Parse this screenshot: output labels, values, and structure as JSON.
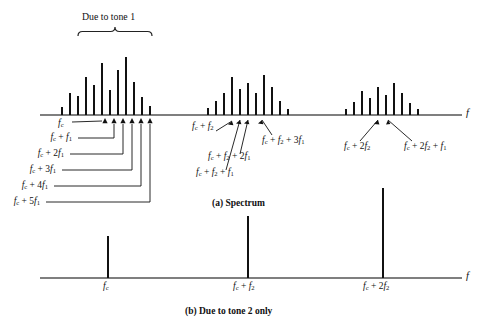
{
  "figure": {
    "bracket_label": "Due to tone 1",
    "axis_symbol": "f",
    "caption_a": "(a) Spectrum",
    "caption_b": "(b) Due to tone 2 only",
    "ink_color": "#111111",
    "axis_color": "#555555"
  },
  "panel_a": {
    "name": "Spectrum",
    "axis_label": "f",
    "cascade_labels": [
      {
        "id": "fc",
        "text": "fc",
        "html": "<i>f</i><sub>c</sub>"
      },
      {
        "id": "fc_f1",
        "text": "fc + f1",
        "html": "<i>f</i><sub>c</sub> + <i>f</i><sub>1</sub>"
      },
      {
        "id": "fc_2f1",
        "text": "fc + 2f1",
        "html": "<i>f</i><sub>c</sub> + 2<i>f</i><sub>1</sub>"
      },
      {
        "id": "fc_3f1",
        "text": "fc + 3f1",
        "html": "<i>f</i><sub>c</sub> + 3<i>f</i><sub>1</sub>"
      },
      {
        "id": "fc_4f1",
        "text": "fc + 4f1",
        "html": "<i>f</i><sub>c</sub> + 4<i>f</i><sub>1</sub>"
      },
      {
        "id": "fc_5f1",
        "text": "fc + 5f1",
        "html": "<i>f</i><sub>c</sub> + 5<i>f</i><sub>1</sub>"
      }
    ],
    "cluster2_labels": [
      {
        "id": "fc_f2",
        "text": "fc + f2",
        "html": "<i>f</i><sub>c</sub> + <i>f</i><sub>2</sub>"
      },
      {
        "id": "fc_f2_f1",
        "text": "fc + f2 + f1",
        "html": "<i>f</i><sub>c</sub> + <i>f</i><sub>2</sub> + <i>f</i><sub>1</sub>"
      },
      {
        "id": "fc_f2_2f1",
        "text": "fc + f2 + 2f1",
        "html": "<i>f</i><sub>c</sub> + <i>f</i><sub>2</sub> + 2<i>f</i><sub>1</sub>"
      },
      {
        "id": "fc_f2_3f1",
        "text": "fc + f2 + 3f1",
        "html": "<i>f</i><sub>c</sub> + <i>f</i><sub>2</sub> + 3<i>f</i><sub>1</sub>"
      }
    ],
    "cluster3_labels": [
      {
        "id": "fc_2f2",
        "text": "fc + 2f2",
        "html": "<i>f</i><sub>c</sub> + 2<i>f</i><sub>2</sub>"
      },
      {
        "id": "fc_2f2_f1",
        "text": "fc + 2f2 + f1",
        "html": "<i>f</i><sub>c</sub> + 2<i>f</i><sub>2</sub> + <i>f</i><sub>1</sub>"
      }
    ]
  },
  "panel_b": {
    "name": "Due to tone 2 only",
    "axis_label": "f",
    "tick_labels": [
      {
        "id": "fc",
        "text": "fc",
        "html": "<i>f</i><sub>c</sub>"
      },
      {
        "id": "fc_f2",
        "text": "fc + f2",
        "html": "<i>f</i><sub>c</sub> + <i>f</i><sub>2</sub>"
      },
      {
        "id": "fc_2f2",
        "text": "fc + 2f2",
        "html": "<i>f</i><sub>c</sub> + 2<i>f</i><sub>2</sub>"
      }
    ]
  },
  "chart_data": {
    "type": "bar",
    "xlabel": "f",
    "ylabel": "",
    "grid": false,
    "legend": null,
    "axis_baseline_a": 115,
    "axis_baseline_b": 278,
    "panels": [
      {
        "id": "a",
        "caption": "(a) Spectrum",
        "axis_label": "f",
        "axis_x_start": 40,
        "axis_x_end": 462,
        "clusters": [
          {
            "name": "cluster-1",
            "center_label": "fc",
            "x": [
              62,
              70,
              78,
              86,
              94,
              102,
              110,
              118,
              126,
              134,
              142,
              150
            ],
            "heights": [
              8,
              22,
              19,
              38,
              30,
              52,
              25,
              45,
              58,
              33,
              18,
              9
            ]
          },
          {
            "name": "cluster-2",
            "center_label": "fc + f2",
            "x": [
              208,
              216,
              224,
              232,
              240,
              248,
              256,
              264,
              272,
              280,
              288
            ],
            "heights": [
              7,
              14,
              22,
              38,
              26,
              32,
              22,
              40,
              28,
              14,
              6
            ]
          },
          {
            "name": "cluster-3",
            "center_label": "fc + 2f2",
            "x": [
              346,
              354,
              362,
              370,
              378,
              386,
              394,
              402,
              410,
              418
            ],
            "heights": [
              6,
              13,
              24,
              17,
              28,
              20,
              32,
              22,
              12,
              6
            ]
          }
        ]
      },
      {
        "id": "b",
        "caption": "(b) Due to tone 2 only",
        "axis_label": "f",
        "axis_x_start": 40,
        "axis_x_end": 462,
        "lines": [
          {
            "label": "fc",
            "x": 108,
            "height": 42
          },
          {
            "label": "fc + f2",
            "x": 248,
            "height": 62
          },
          {
            "label": "fc + 2f2",
            "x": 383,
            "height": 90
          }
        ]
      }
    ]
  }
}
